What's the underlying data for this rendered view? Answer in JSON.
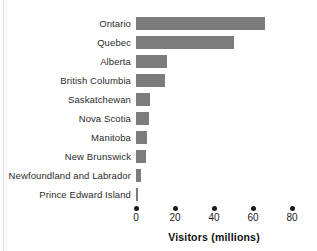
{
  "chart_data": {
    "type": "bar",
    "orientation": "horizontal",
    "title": "",
    "xlabel": "Visitors (millions)",
    "ylabel": "",
    "categories": [
      "Ontario",
      "Quebec",
      "Alberta",
      "British Columbia",
      "Saskatchewan",
      "Nova Scotia",
      "Manitoba",
      "New Brunswick",
      "Newfoundland and Labrador",
      "Prince Edward Island"
    ],
    "values": [
      66,
      50,
      16,
      15,
      7,
      6.5,
      5.5,
      5,
      2.5,
      1
    ],
    "xlim": [
      0,
      80
    ],
    "xticks": [
      0,
      20,
      40,
      60,
      80
    ],
    "xtick_labels": [
      "0",
      "20",
      "40",
      "60",
      "80"
    ],
    "grid": false,
    "legend": false,
    "bar_color": "#7c7c7c",
    "axis_color": "#1a1a1a",
    "text_color": "#2b2b2b"
  }
}
